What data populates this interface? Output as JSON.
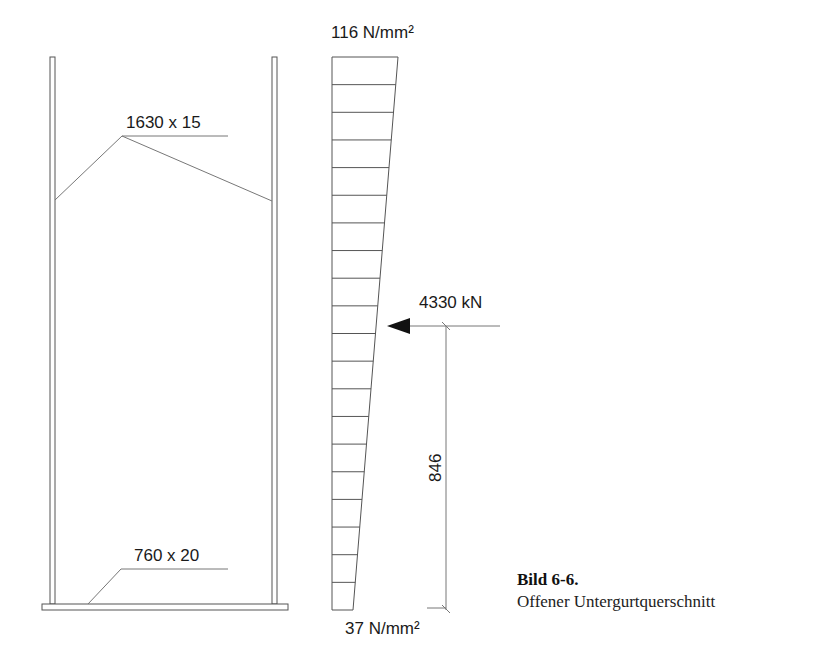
{
  "figure": {
    "caption": {
      "number": "Bild 6-6.",
      "text": "Offener Untergurtquerschnitt"
    },
    "cross_section": {
      "web_label": "1630 x 15",
      "flange_label": "760 x 20"
    },
    "stress_diagram": {
      "top_stress": "116 N/mm²",
      "bottom_stress": "37 N/mm²",
      "strip_count": 20
    },
    "force": {
      "label": "4330 kN",
      "direction": "left"
    },
    "dimension": {
      "lever_arm": "846"
    },
    "colors": {
      "line": "#555555",
      "text": "#1a1a1a",
      "background": "#ffffff"
    }
  }
}
